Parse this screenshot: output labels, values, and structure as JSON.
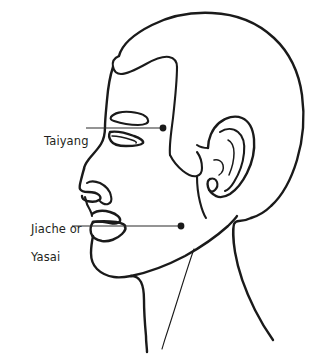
{
  "figure": {
    "type": "line-art anatomical diagram",
    "background_color": "#ffffff",
    "line_color": "#1a1a1a",
    "text_color": "#231f20"
  },
  "labels": [
    {
      "id": "taiyang",
      "text": "Taiyang",
      "lines": [
        "Taiyang"
      ],
      "point_x": 163,
      "point_y": 128,
      "leader_from_x": 86,
      "leader_to_x": 160,
      "leader_y": 128
    },
    {
      "id": "jiache",
      "text": "Jiache or Yasai",
      "lines": [
        "Jiache or",
        "Yasai"
      ],
      "point_x": 181,
      "point_y": 226,
      "leader_from_x": 72,
      "leader_to_x": 178,
      "leader_y": 226
    }
  ],
  "label_taiyang": {
    "line1": "Taiyang"
  },
  "label_jiache": {
    "line1": "Jiache or",
    "line2": "Yasai"
  },
  "anatomy_parts": [
    "skull-outline",
    "hairline",
    "forehead",
    "eyebrow",
    "eye",
    "nose",
    "nostril",
    "upper-lip",
    "lower-lip",
    "chin",
    "jawline",
    "ear-helix",
    "ear-antihelix",
    "ear-tragus",
    "ear-lobe",
    "neck",
    "sternocleidomastoid"
  ]
}
